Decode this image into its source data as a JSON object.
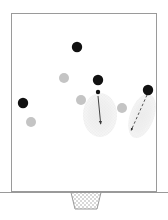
{
  "figure": {
    "header_text": "",
    "background_color": "#ffffff",
    "pitch": {
      "label": "soccer-pitch",
      "x": 11,
      "y": 13,
      "width": 146,
      "height": 179,
      "border_color": "#9a9a9a",
      "fill_color": "#ffffff",
      "border_width": 1
    },
    "goal": {
      "label": "goal-net",
      "top_left_x": 71,
      "top_right_x": 101,
      "bottom_left_x": 75,
      "bottom_right_x": 97,
      "top_y": 192,
      "bottom_y": 209,
      "fill_pattern": "checker",
      "pattern_color": "#d6d6d6",
      "border_color": "#9a9a9a"
    },
    "ground_line": {
      "label": "ground-line",
      "x1": 0,
      "x2": 168,
      "y": 192,
      "color": "#9a9a9a"
    }
  },
  "chart_data": {
    "type": "scatter",
    "title": "",
    "xlabel": "",
    "ylabel": "",
    "xlim": [
      11,
      157
    ],
    "ylim": [
      13,
      192
    ],
    "grid": false,
    "legend": "none",
    "colors": {
      "dark_team": "#111111",
      "light_team": "#c4c4c4",
      "ball": "#111111",
      "zone_fill": "#efefef",
      "arrow": "#333333",
      "pitch_line": "#9a9a9a"
    },
    "series": [
      {
        "name": "dark-team-players",
        "marker": "filled-circle",
        "color": "#111111",
        "radius": 5.2,
        "points": [
          {
            "id": "dark-1",
            "x": 77,
            "y": 47
          },
          {
            "id": "dark-2",
            "x": 98,
            "y": 80
          },
          {
            "id": "dark-3",
            "x": 23,
            "y": 103
          },
          {
            "id": "dark-4",
            "x": 148,
            "y": 90
          }
        ]
      },
      {
        "name": "light-team-players",
        "marker": "filled-circle",
        "color": "#c4c4c4",
        "radius": 5.0,
        "points": [
          {
            "id": "light-1",
            "x": 64,
            "y": 78
          },
          {
            "id": "light-2",
            "x": 81,
            "y": 100
          },
          {
            "id": "light-3",
            "x": 31,
            "y": 122
          },
          {
            "id": "light-4",
            "x": 122,
            "y": 108
          }
        ]
      },
      {
        "name": "ball",
        "marker": "small-filled-circle",
        "color": "#111111",
        "radius": 2.2,
        "points": [
          {
            "id": "ball-1",
            "x": 98,
            "y": 92
          }
        ]
      }
    ],
    "zones": [
      {
        "id": "zone-left",
        "name": "shaded-zone-center",
        "cx": 100,
        "cy": 115,
        "rx": 17,
        "ry": 22,
        "rotation": 0,
        "fill": "#efefef",
        "hatch": "fine-grid"
      },
      {
        "id": "zone-right",
        "name": "shaded-zone-right",
        "cx": 142,
        "cy": 116,
        "rx": 12,
        "ry": 23,
        "rotation": 20,
        "fill": "#efefef",
        "hatch": "fine-grid"
      }
    ],
    "arrows": [
      {
        "id": "arrow-solid",
        "name": "ball-movement-arrow",
        "style": "solid",
        "color": "#444444",
        "x1": 98,
        "y1": 96,
        "x2": 101,
        "y2": 127,
        "arrowhead": "filled-triangle"
      },
      {
        "id": "arrow-dashed",
        "name": "player-run-arrow",
        "style": "dashed",
        "color": "#555555",
        "x1": 147,
        "y1": 95,
        "x2": 130,
        "y2": 133,
        "arrowhead": "filled-triangle"
      }
    ]
  }
}
